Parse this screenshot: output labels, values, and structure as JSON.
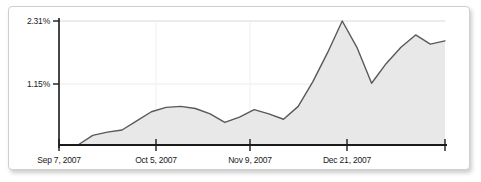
{
  "chart_data": {
    "type": "area",
    "title": "",
    "subtitle": "",
    "xlabel": "",
    "ylabel": "",
    "grid": true,
    "legend": null,
    "legend_position": "none",
    "ylim": [
      0,
      2.31
    ],
    "y_ticks": [
      {
        "value": 1.15,
        "label": "1.15%"
      },
      {
        "value": 2.31,
        "label": "2.31%"
      }
    ],
    "x_ticks": [
      {
        "index": 0,
        "label": "Sep 7, 2007"
      },
      {
        "index": 7,
        "label": "Oct 5, 2007"
      },
      {
        "index": 14,
        "label": "Nov 9, 2007"
      },
      {
        "index": 21,
        "label": "Dec 21, 2007"
      }
    ],
    "x": [
      "Sep 7, 2007",
      "Sep 9, 2007",
      "Sep 11, 2007",
      "Sep 14, 2007",
      "Sep 17, 2007",
      "Sep 21, 2007",
      "Sep 25, 2007",
      "Oct 5, 2007",
      "Oct 9, 2007",
      "Oct 14, 2007",
      "Oct 19, 2007",
      "Oct 24, 2007",
      "Oct 30, 2007",
      "Nov 4, 2007",
      "Nov 9, 2007",
      "Nov 14, 2007",
      "Nov 20, 2007",
      "Nov 26, 2007",
      "Dec 2, 2007",
      "Dec 9, 2007",
      "Dec 15, 2007",
      "Dec 21, 2007",
      "Dec 27, 2007",
      "Jan 2, 2008",
      "Jan 8, 2008",
      "Jan 14, 2008"
    ],
    "values": [
      0.0,
      0.18,
      0.24,
      0.28,
      0.45,
      0.62,
      0.7,
      0.72,
      0.68,
      0.58,
      0.42,
      0.52,
      0.66,
      0.58,
      0.48,
      0.72,
      1.18,
      1.72,
      2.31,
      1.82,
      1.15,
      1.52,
      1.82,
      2.05,
      1.88,
      1.94
    ],
    "series": [
      {
        "name": "share",
        "values": [
          0.0,
          0.18,
          0.24,
          0.28,
          0.45,
          0.62,
          0.7,
          0.72,
          0.68,
          0.58,
          0.42,
          0.52,
          0.66,
          0.58,
          0.48,
          0.72,
          1.18,
          1.72,
          2.31,
          1.82,
          1.15,
          1.52,
          1.82,
          2.05,
          1.88,
          1.94
        ]
      }
    ],
    "colors": {
      "area_fill": "#e8e8e8",
      "line": "#595959",
      "axis": "#1a1a1a",
      "gridline": "#e0e0e0",
      "panel_border": "#cfcfcf",
      "text": "#1a1a1a"
    }
  }
}
